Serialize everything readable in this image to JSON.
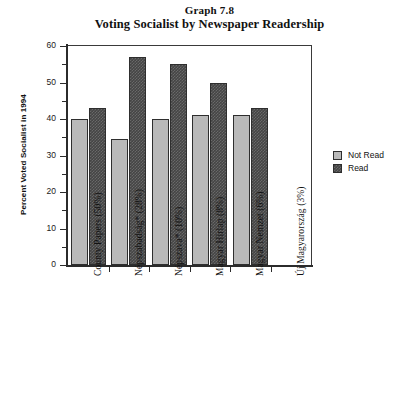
{
  "chart_data": {
    "type": "bar",
    "title": "Voting Socialist by Newspaper Readership",
    "supertitle": "Graph 7.8",
    "xlabel": "",
    "ylabel": "Percent Voted Socialist in 1994",
    "ylim": [
      0,
      60
    ],
    "ytick_step": 10,
    "yminor_step": 5,
    "grid": false,
    "legend_position": "right",
    "categories": [
      "County Papers (50%)",
      "Népszabadság* (28%)",
      "Népszava* (10%)",
      "Magyar Hírlap (8%)",
      "Magyar Nemzet (6%)",
      "Új Magyarország (3%)"
    ],
    "series": [
      {
        "name": "Not Read",
        "color": "#b9b9b9",
        "values": [
          40,
          34.5,
          40,
          41,
          41,
          null
        ]
      },
      {
        "name": "Read",
        "color": "#454545",
        "values": [
          43,
          57,
          55,
          50,
          43,
          null
        ]
      }
    ],
    "ytick_labels": [
      "0",
      "10",
      "20",
      "30",
      "40",
      "50",
      "60"
    ]
  },
  "legend": {
    "items": [
      {
        "label": "Not Read",
        "key": "notread"
      },
      {
        "label": "Read",
        "key": "read"
      }
    ]
  }
}
